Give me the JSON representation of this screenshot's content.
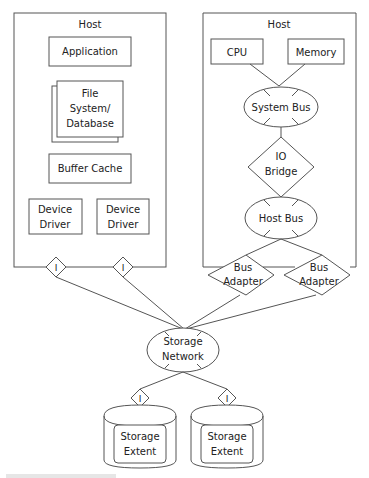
{
  "diagram": {
    "left_host": {
      "label": "Host",
      "application": "Application",
      "file_system": [
        "File",
        "System/",
        "Database"
      ],
      "buffer_cache": "Buffer Cache",
      "device_driver_1": [
        "Device",
        "Driver"
      ],
      "device_driver_2": [
        "Device",
        "Driver"
      ],
      "port_1": "I",
      "port_2": "I"
    },
    "right_host": {
      "label": "Host",
      "cpu": "CPU",
      "memory": "Memory",
      "system_bus": "System Bus",
      "io_bridge": [
        "IO",
        "Bridge"
      ],
      "host_bus": "Host Bus",
      "bus_adapter_1": [
        "Bus",
        "Adapter"
      ],
      "bus_adapter_2": [
        "Bus",
        "Adapter"
      ]
    },
    "storage_network": [
      "Storage",
      "Network"
    ],
    "storage_1": {
      "port": "I",
      "label": [
        "Storage",
        "Extent"
      ]
    },
    "storage_2": {
      "port": "I",
      "label": [
        "Storage",
        "Extent"
      ]
    }
  }
}
